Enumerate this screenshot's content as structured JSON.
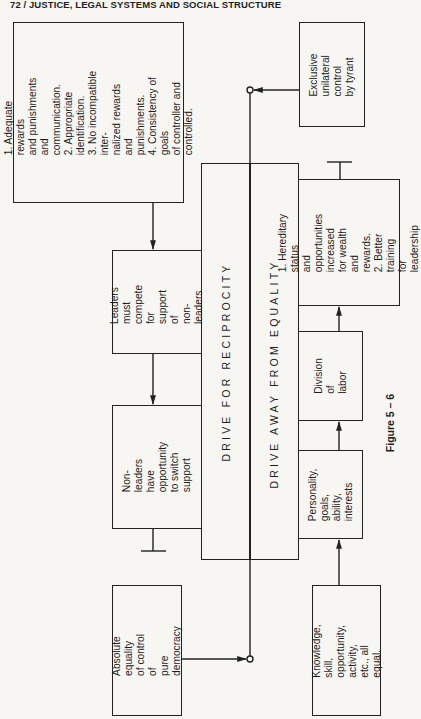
{
  "header": {
    "title": "72 / JUSTICE, LEGAL SYSTEMS AND SOCIAL STRUCTURE"
  },
  "diagram": {
    "conditions_box": "1. Adequate rewards\nand punishments and\ncommunication.\n2. Appropriate identification.\n3. No incompatible inter-\nnalized rewards and\npunishments.\n4. Consistency of goals\nof controller and\ncontrolled.",
    "leaders_box": "Leaders must\ncompete for\nsupport of\nnon-leaders",
    "nonleaders_box": "Non-leaders\nhave opportunity\nto switch support",
    "absolute_box": "Absolute equality\nof control of\npure democracy",
    "drive_reciprocity": "DRIVE FOR RECIPROCITY",
    "drive_away": "DRIVE AWAY FROM EQUALITY",
    "tyrant_box": "Exclusive unilateral\ncontrol by tyrant",
    "hereditary_box": "1. Hereditary status\nand opportunities\nincreased for wealth\nand rewards.\n2. Better training\nfor leadership",
    "division_box": "Division of\nlabor",
    "personality_box": "Personality,\ngoals, ability,\ninterests",
    "knowledge_box": "Knowledge, skill,\nopportunity, activity,\netc., all equal.",
    "figure_label": "Figure 5 – 6"
  }
}
